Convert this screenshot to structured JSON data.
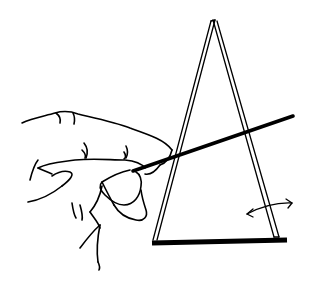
{
  "illustration": {
    "description": "Line drawing of a hand holding a thin stick touching a tall narrow triangular frame (A-frame) standing on a thick base bar, with a curved double-headed arrow indicating rocking motion",
    "elements": {
      "hand": "hand-gripping-stick",
      "stick": "thin-stick",
      "frame": "a-frame-triangle",
      "base": "base-bar",
      "arrow": "double-headed-curved-arrow"
    },
    "colors": {
      "ink": "#000000",
      "background": "#ffffff"
    }
  }
}
